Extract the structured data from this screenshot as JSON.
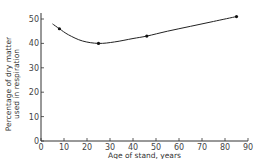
{
  "chart_data": {
    "type": "line",
    "title": "",
    "xlabel": "Age of stand, years",
    "ylabel_lines": [
      "Percentage of dry matter",
      "used in respiration"
    ],
    "ylabel": "Percentage of dry matter used in respiration",
    "xlim": [
      0,
      90
    ],
    "ylim": [
      0,
      50
    ],
    "xticks": [
      0,
      10,
      20,
      30,
      40,
      50,
      60,
      70,
      80,
      90
    ],
    "yticks": [
      0,
      10,
      20,
      30,
      40,
      50
    ],
    "grid": false,
    "series": [
      {
        "name": "observed",
        "points": [
          {
            "x": 8,
            "y": 46
          },
          {
            "x": 25,
            "y": 40
          },
          {
            "x": 46,
            "y": 43
          },
          {
            "x": 85,
            "y": 51
          }
        ],
        "curve": [
          {
            "x": 5,
            "y": 48
          },
          {
            "x": 8,
            "y": 46
          },
          {
            "x": 12,
            "y": 43.5
          },
          {
            "x": 18,
            "y": 41
          },
          {
            "x": 25,
            "y": 40
          },
          {
            "x": 32,
            "y": 40.6
          },
          {
            "x": 40,
            "y": 42
          },
          {
            "x": 46,
            "y": 43
          },
          {
            "x": 55,
            "y": 45
          },
          {
            "x": 65,
            "y": 47
          },
          {
            "x": 75,
            "y": 49
          },
          {
            "x": 85,
            "y": 51
          }
        ]
      }
    ]
  }
}
